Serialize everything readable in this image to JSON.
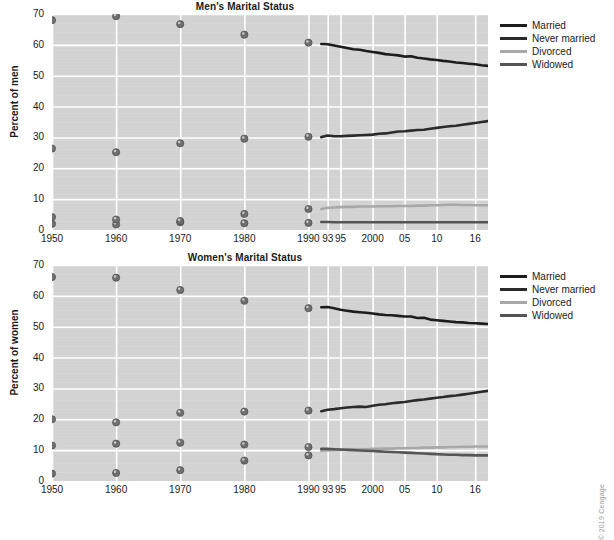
{
  "figure": {
    "copyright": "© 2019 Cengage",
    "background": "#ffffff",
    "plot_background": "#d2d2d2",
    "grid_color": "#ffffff"
  },
  "legend": {
    "position": "right",
    "items": [
      {
        "label": "Married",
        "color": "#1d1d1d"
      },
      {
        "label": "Never married",
        "color": "#2b2b2b"
      },
      {
        "label": "Divorced",
        "color": "#a8a8a8"
      },
      {
        "label": "Widowed",
        "color": "#555555"
      }
    ]
  },
  "chart_data": [
    {
      "type": "scatter",
      "id": "men",
      "title": "Men's Marital Status",
      "xlabel": "",
      "ylabel": "Percent of men",
      "ylim": [
        0,
        70
      ],
      "yticks": [
        0,
        10,
        20,
        30,
        40,
        50,
        60,
        70
      ],
      "xticks": [
        "1950",
        "1960",
        "1970",
        "1980",
        "1990",
        "93",
        "95",
        "2000",
        "05",
        "10",
        "16"
      ],
      "xtick_years": [
        1950,
        1960,
        1970,
        1980,
        1990,
        1993,
        1995,
        2000,
        2005,
        2010,
        2016
      ],
      "xlim": [
        1950,
        2018
      ],
      "grid": true,
      "marker_years": [
        1950,
        1960,
        1970,
        1980,
        1990
      ],
      "series": [
        {
          "name": "Married",
          "color": "#1d1d1d",
          "markers": [
            68.0,
            69.3,
            66.7,
            63.3,
            60.7
          ],
          "line_x": [
            1992,
            1993,
            1994,
            1995,
            1996,
            1997,
            1998,
            1999,
            2000,
            2001,
            2002,
            2003,
            2004,
            2005,
            2006,
            2007,
            2008,
            2009,
            2010,
            2011,
            2012,
            2013,
            2014,
            2015,
            2016,
            2017,
            2018
          ],
          "line_y": [
            60.3,
            60.2,
            59.8,
            59.4,
            59.0,
            58.6,
            58.4,
            58.0,
            57.7,
            57.4,
            57.0,
            56.8,
            56.6,
            56.2,
            56.3,
            55.8,
            55.6,
            55.3,
            55.1,
            54.8,
            54.6,
            54.3,
            54.1,
            53.9,
            53.7,
            53.4,
            53.2
          ]
        },
        {
          "name": "Never married",
          "color": "#2b2b2b",
          "markers": [
            26.4,
            25.2,
            28.1,
            29.6,
            30.2
          ],
          "line_x": [
            1992,
            1993,
            1994,
            1995,
            1996,
            1997,
            1998,
            1999,
            2000,
            2001,
            2002,
            2003,
            2004,
            2005,
            2006,
            2007,
            2008,
            2009,
            2010,
            2011,
            2012,
            2013,
            2014,
            2015,
            2016,
            2017,
            2018
          ],
          "line_y": [
            30.1,
            30.6,
            30.4,
            30.4,
            30.5,
            30.6,
            30.7,
            30.8,
            30.9,
            31.2,
            31.3,
            31.6,
            31.9,
            32.0,
            32.2,
            32.4,
            32.5,
            32.8,
            33.1,
            33.4,
            33.6,
            33.8,
            34.1,
            34.4,
            34.7,
            35.0,
            35.3
          ]
        },
        {
          "name": "Divorced",
          "color": "#a8a8a8",
          "markers": [
            2.0,
            1.8,
            2.5,
            5.2,
            6.8
          ],
          "line_x": [
            1992,
            1993,
            1994,
            1995,
            1996,
            1997,
            1998,
            1999,
            2000,
            2001,
            2002,
            2003,
            2004,
            2005,
            2006,
            2007,
            2008,
            2009,
            2010,
            2011,
            2012,
            2013,
            2014,
            2015,
            2016,
            2017,
            2018
          ],
          "line_y": [
            6.8,
            7.2,
            7.3,
            7.4,
            7.5,
            7.5,
            7.6,
            7.6,
            7.6,
            7.7,
            7.7,
            7.7,
            7.8,
            7.8,
            7.8,
            7.9,
            7.9,
            8.0,
            8.0,
            8.1,
            8.2,
            8.2,
            8.1,
            8.1,
            8.0,
            8.0,
            8.0
          ]
        },
        {
          "name": "Widowed",
          "color": "#555555",
          "markers": [
            4.2,
            3.4,
            2.9,
            2.2,
            2.3
          ],
          "line_x": [
            1992,
            1993,
            1994,
            1995,
            1996,
            1997,
            1998,
            1999,
            2000,
            2001,
            2002,
            2003,
            2004,
            2005,
            2006,
            2007,
            2008,
            2009,
            2010,
            2011,
            2012,
            2013,
            2014,
            2015,
            2016,
            2017,
            2018
          ],
          "line_y": [
            2.6,
            2.6,
            2.5,
            2.5,
            2.5,
            2.5,
            2.5,
            2.5,
            2.5,
            2.5,
            2.5,
            2.5,
            2.5,
            2.5,
            2.5,
            2.5,
            2.5,
            2.5,
            2.5,
            2.5,
            2.5,
            2.5,
            2.5,
            2.5,
            2.5,
            2.5,
            2.5
          ]
        }
      ]
    },
    {
      "type": "scatter",
      "id": "women",
      "title": "Women's Marital Status",
      "xlabel": "",
      "ylabel": "Percent of women",
      "ylim": [
        0,
        70
      ],
      "yticks": [
        0,
        10,
        20,
        30,
        40,
        50,
        60,
        70
      ],
      "xticks": [
        "1950",
        "1960",
        "1970",
        "1980",
        "1990",
        "93",
        "95",
        "2000",
        "05",
        "10",
        "16"
      ],
      "xtick_years": [
        1950,
        1960,
        1970,
        1980,
        1990,
        1993,
        1995,
        2000,
        2005,
        2010,
        2016
      ],
      "xlim": [
        1950,
        2018
      ],
      "grid": true,
      "marker_years": [
        1950,
        1960,
        1970,
        1980,
        1990
      ],
      "series": [
        {
          "name": "Married",
          "color": "#1d1d1d",
          "markers": [
            66.1,
            65.9,
            61.9,
            58.4,
            56.0
          ],
          "line_x": [
            1992,
            1993,
            1994,
            1995,
            1996,
            1997,
            1998,
            1999,
            2000,
            2001,
            2002,
            2003,
            2004,
            2005,
            2006,
            2007,
            2008,
            2009,
            2010,
            2011,
            2012,
            2013,
            2014,
            2015,
            2016,
            2017,
            2018
          ],
          "line_y": [
            56.3,
            56.4,
            56.0,
            55.5,
            55.2,
            54.9,
            54.7,
            54.5,
            54.3,
            54.0,
            53.8,
            53.7,
            53.5,
            53.3,
            53.3,
            52.8,
            52.9,
            52.3,
            52.1,
            51.9,
            51.7,
            51.5,
            51.4,
            51.2,
            51.1,
            51.0,
            50.9
          ]
        },
        {
          "name": "Never married",
          "color": "#2b2b2b",
          "markers": [
            20.0,
            19.0,
            22.1,
            22.5,
            22.8
          ],
          "line_x": [
            1992,
            1993,
            1994,
            1995,
            1996,
            1997,
            1998,
            1999,
            2000,
            2001,
            2002,
            2003,
            2004,
            2005,
            2006,
            2007,
            2008,
            2009,
            2010,
            2011,
            2012,
            2013,
            2014,
            2015,
            2016,
            2017,
            2018
          ],
          "line_y": [
            22.6,
            23.1,
            23.3,
            23.6,
            23.8,
            24.0,
            24.1,
            24.0,
            24.4,
            24.7,
            24.9,
            25.2,
            25.4,
            25.6,
            25.9,
            26.2,
            26.4,
            26.7,
            27.0,
            27.2,
            27.5,
            27.7,
            28.0,
            28.3,
            28.6,
            28.9,
            29.2
          ]
        },
        {
          "name": "Divorced",
          "color": "#a8a8a8",
          "markers": [
            2.4,
            2.6,
            3.5,
            6.6,
            8.3
          ],
          "line_x": [
            1992,
            1993,
            1994,
            1995,
            1996,
            1997,
            1998,
            1999,
            2000,
            2001,
            2002,
            2003,
            2004,
            2005,
            2006,
            2007,
            2008,
            2009,
            2010,
            2011,
            2012,
            2013,
            2014,
            2015,
            2016,
            2017,
            2018
          ],
          "line_y": [
            9.8,
            9.9,
            10.0,
            10.1,
            10.2,
            10.2,
            10.3,
            10.3,
            10.4,
            10.4,
            10.5,
            10.5,
            10.6,
            10.6,
            10.7,
            10.7,
            10.8,
            10.8,
            10.9,
            10.9,
            11.0,
            11.0,
            11.1,
            11.1,
            11.2,
            11.2,
            11.2
          ]
        },
        {
          "name": "Widowed",
          "color": "#555555",
          "markers": [
            11.5,
            12.1,
            12.4,
            11.8,
            11.0
          ],
          "line_x": [
            1992,
            1993,
            1994,
            1995,
            1996,
            1997,
            1998,
            1999,
            2000,
            2001,
            2002,
            2003,
            2004,
            2005,
            2006,
            2007,
            2008,
            2009,
            2010,
            2011,
            2012,
            2013,
            2014,
            2015,
            2016,
            2017,
            2018
          ],
          "line_y": [
            10.4,
            10.4,
            10.3,
            10.2,
            10.1,
            10.0,
            9.9,
            9.8,
            9.7,
            9.6,
            9.5,
            9.4,
            9.3,
            9.2,
            9.1,
            9.0,
            8.9,
            8.8,
            8.7,
            8.6,
            8.5,
            8.5,
            8.4,
            8.4,
            8.3,
            8.3,
            8.3
          ]
        }
      ]
    }
  ]
}
